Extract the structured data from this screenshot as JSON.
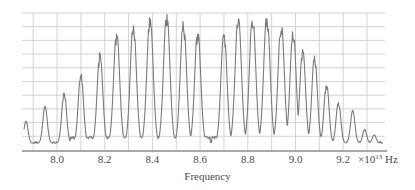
{
  "chart_data": {
    "type": "line",
    "title": "",
    "xlabel": "Frequency",
    "ylabel": "",
    "x_unit": "× 10^13 Hz",
    "x_unit_parts": {
      "times": "×",
      "base": "10",
      "exp": "13",
      "hz": "Hz"
    },
    "xlim": [
      7.86,
      9.38
    ],
    "ylim": [
      0,
      1
    ],
    "grid": true,
    "legend": "none",
    "x_ticks": [
      {
        "value": 8.0,
        "label": "8.0"
      },
      {
        "value": 8.2,
        "label": "8.2"
      },
      {
        "value": 8.4,
        "label": "8.4"
      },
      {
        "value": 8.6,
        "label": "8.6"
      },
      {
        "value": 8.8,
        "label": "8.8"
      },
      {
        "value": 9.0,
        "label": "9.0"
      },
      {
        "value": 9.2,
        "label": "9.2"
      }
    ],
    "x_gridlines": [
      7.9,
      8.0,
      8.1,
      8.2,
      8.3,
      8.4,
      8.5,
      8.6,
      8.7,
      8.8,
      8.9,
      9.0,
      9.1,
      9.2,
      9.3
    ],
    "y_gridlines": 10,
    "series": [
      {
        "name": "Absorption spectrum",
        "color": "#7a7a7a",
        "peaks": [
          {
            "x": 7.87,
            "y": 0.16
          },
          {
            "x": 7.95,
            "y": 0.27
          },
          {
            "x": 8.03,
            "y": 0.38
          },
          {
            "x": 8.1,
            "y": 0.52
          },
          {
            "x": 8.18,
            "y": 0.67
          },
          {
            "x": 8.25,
            "y": 0.83
          },
          {
            "x": 8.32,
            "y": 0.89
          },
          {
            "x": 8.39,
            "y": 0.94
          },
          {
            "x": 8.46,
            "y": 0.97
          },
          {
            "x": 8.53,
            "y": 0.91
          },
          {
            "x": 8.59,
            "y": 0.84
          },
          {
            "x": 8.7,
            "y": 0.83
          },
          {
            "x": 8.76,
            "y": 0.94
          },
          {
            "x": 8.82,
            "y": 0.95
          },
          {
            "x": 8.88,
            "y": 0.96
          },
          {
            "x": 8.94,
            "y": 0.9
          },
          {
            "x": 8.99,
            "y": 0.84
          },
          {
            "x": 9.03,
            "y": 0.7
          },
          {
            "x": 9.08,
            "y": 0.65
          },
          {
            "x": 9.13,
            "y": 0.45
          },
          {
            "x": 9.18,
            "y": 0.31
          },
          {
            "x": 9.24,
            "y": 0.24
          },
          {
            "x": 9.29,
            "y": 0.1
          },
          {
            "x": 9.33,
            "y": 0.06
          }
        ],
        "baseline": 0.05,
        "gap_center": 8.645
      }
    ]
  }
}
